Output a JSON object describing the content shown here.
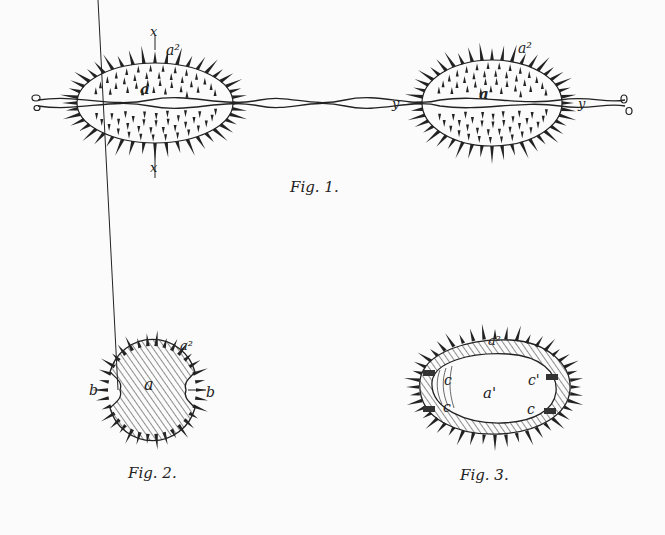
{
  "figures": [
    {
      "id": "fig1",
      "caption": "Fig. 1.",
      "labels": {
        "a2_left": "a²",
        "a_left": "a",
        "x_top": "x",
        "x_bottom": "x",
        "a2_right": "a²",
        "a_right": "a",
        "y_left": "y",
        "y_right": "y"
      }
    },
    {
      "id": "fig2",
      "caption": "Fig. 2.",
      "labels": {
        "a2": "a²",
        "a": "a",
        "b_left": "b",
        "b_right": "b"
      }
    },
    {
      "id": "fig3",
      "caption": "Fig. 3.",
      "labels": {
        "a2": "a²",
        "a1": "a'",
        "c_top_left": "c",
        "c_bottom_left": "c",
        "c_top_right": "c'",
        "c_bottom_right": "c"
      }
    }
  ],
  "colors": {
    "ink": "#222222",
    "paper": "#fbfbfb"
  }
}
